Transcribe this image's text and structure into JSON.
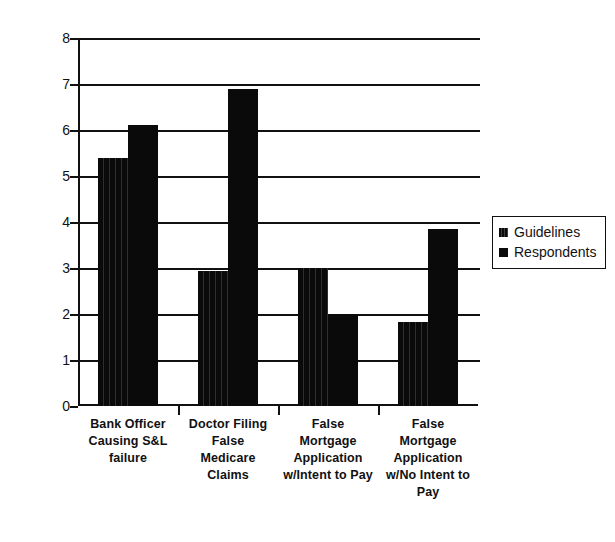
{
  "chart_data": {
    "type": "bar",
    "title": "",
    "xlabel": "",
    "ylabel": "",
    "ylim": [
      0,
      8
    ],
    "ytick_labels": [
      "8",
      "7",
      "6",
      "5",
      "4",
      "3",
      "2",
      "1",
      "0"
    ],
    "ytick_values": [
      8,
      7,
      6,
      5,
      4,
      3,
      2,
      1,
      0
    ],
    "grid": true,
    "legend_position": "right",
    "categories": [
      "Bank Officer Causing S&L failure",
      "Doctor Filing False Medicare Claims",
      "False Mortgage Application w/Intent to Pay",
      "False Mortgage Application w/No Intent to Pay"
    ],
    "category_lines": [
      [
        "Bank Officer",
        "Causing S&L",
        "failure"
      ],
      [
        "Doctor Filing",
        "False",
        "Medicare",
        "Claims"
      ],
      [
        "False",
        "Mortgage",
        "Application",
        "w/Intent to Pay"
      ],
      [
        "False",
        "Mortgage",
        "Application",
        "w/No Intent to",
        "Pay"
      ]
    ],
    "series": [
      {
        "name": "Guidelines",
        "color": "#0a0a0a",
        "values": [
          5.4,
          2.93,
          3.0,
          1.83
        ]
      },
      {
        "name": "Respondents",
        "color": "#0a0a0a",
        "values": [
          6.1,
          6.9,
          2.0,
          3.85
        ]
      }
    ]
  },
  "legend": {
    "items": [
      {
        "label": "Guidelines",
        "swatch": "legend-swatch-guidelines"
      },
      {
        "label": "Respondents",
        "swatch": "legend-swatch-respondents"
      }
    ]
  }
}
